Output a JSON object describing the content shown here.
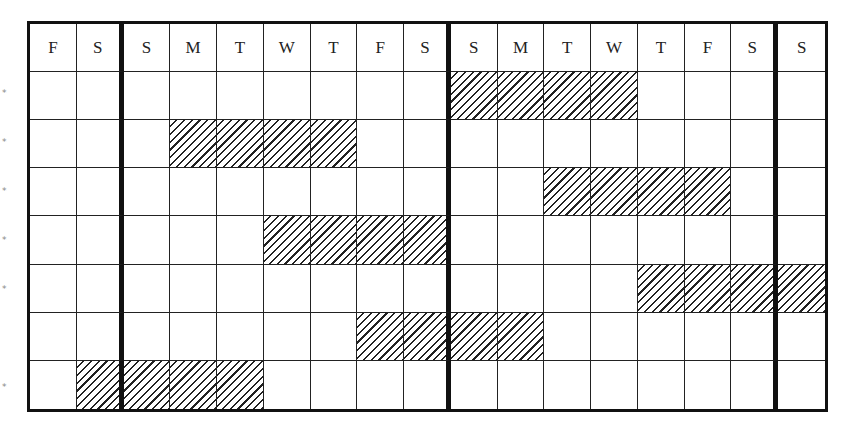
{
  "calendar": {
    "days": [
      "F",
      "S",
      "S",
      "M",
      "T",
      "W",
      "T",
      "F",
      "S",
      "S",
      "M",
      "T",
      "W",
      "T",
      "F",
      "S",
      "S"
    ],
    "week_separators_after_col": [
      1,
      8,
      15
    ],
    "rows": [
      {
        "marker": "*",
        "hatched_cols": [
          9,
          10,
          11,
          12
        ]
      },
      {
        "marker": "*",
        "hatched_cols": [
          3,
          4,
          5,
          6
        ]
      },
      {
        "marker": "*",
        "hatched_cols": [
          11,
          12,
          13,
          14
        ]
      },
      {
        "marker": "*",
        "hatched_cols": [
          5,
          6,
          7,
          8
        ]
      },
      {
        "marker": "*",
        "hatched_cols": [
          13,
          14,
          15,
          16
        ]
      },
      {
        "marker": "",
        "hatched_cols": [
          7,
          8,
          9,
          10
        ]
      },
      {
        "marker": "*",
        "hatched_cols": [
          1,
          2,
          3,
          4
        ]
      }
    ]
  },
  "colors": {
    "line": "#111111",
    "hatch": "#222222",
    "marker": "#888888"
  }
}
